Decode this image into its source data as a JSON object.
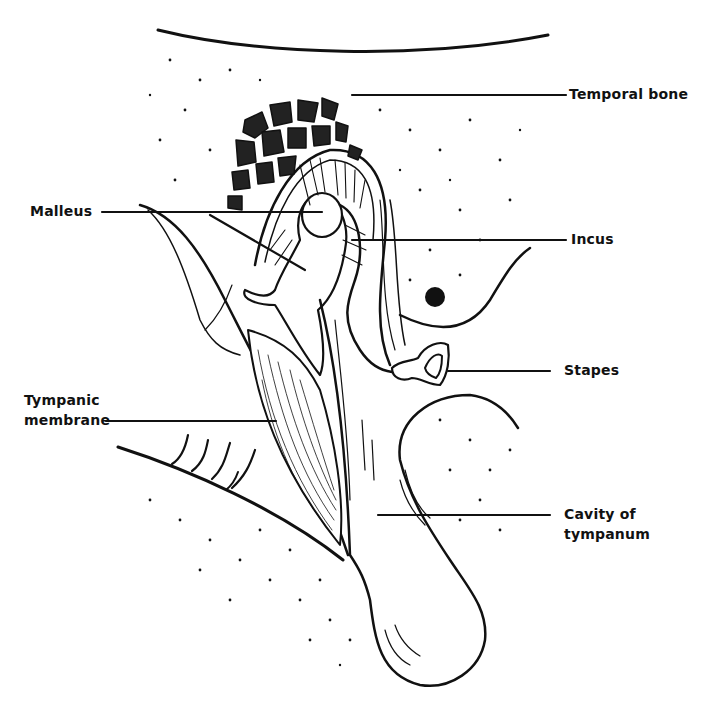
{
  "diagram": {
    "type": "anatomical illustration",
    "ink_color": "#111111",
    "background_color": "#ffffff",
    "labels": [
      {
        "id": "temporal-bone",
        "text": "Temporal bone"
      },
      {
        "id": "malleus",
        "text": "Malleus"
      },
      {
        "id": "incus",
        "text": "Incus"
      },
      {
        "id": "stapes",
        "text": "Stapes"
      },
      {
        "id": "tympanic-membrane",
        "line1": "Tympanic",
        "line2": "membrane"
      },
      {
        "id": "cavity-of-tympanum",
        "line1": "Cavity of",
        "line2": "tympanum"
      }
    ]
  }
}
